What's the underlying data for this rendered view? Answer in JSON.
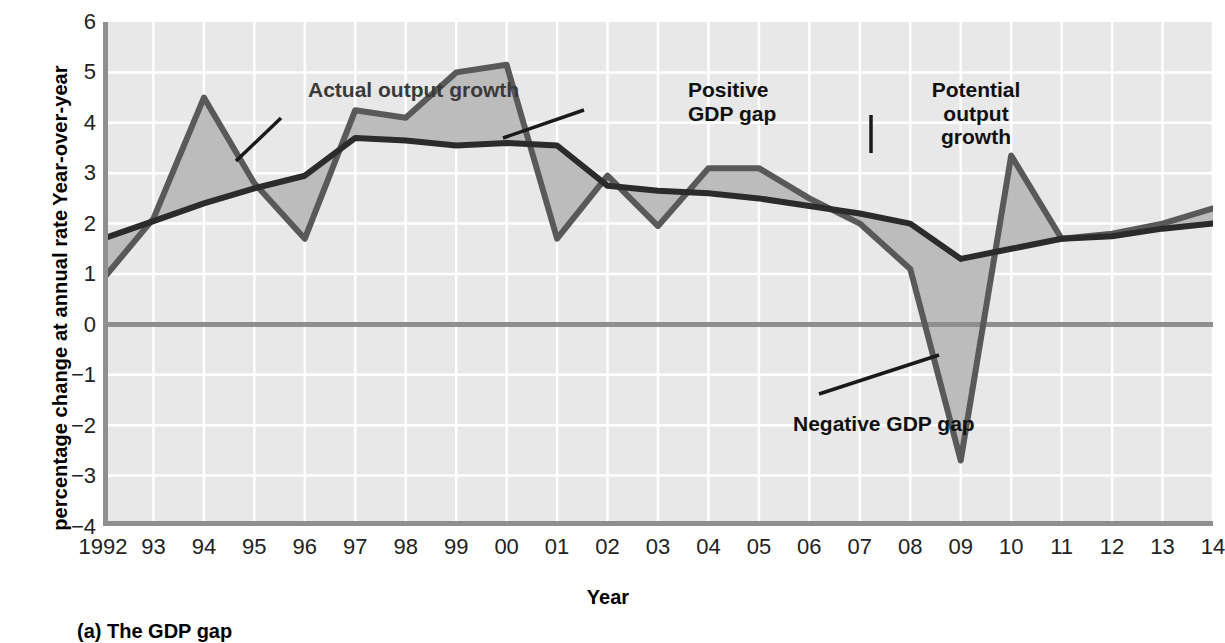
{
  "figure": {
    "caption": "(a) The GDP gap",
    "xlabel": "Year",
    "ylabel_line1": "Year-over-year",
    "ylabel_line2": "percentage change at annual rate"
  },
  "annotations": {
    "actual": "Actual output growth",
    "positive_gap": "Positive\nGDP gap",
    "potential": "Potential\noutput\ngrowth",
    "negative_gap": "Negative GDP gap"
  },
  "colors": {
    "plot_background": "#e8e8e8",
    "gridline": "#ffffff",
    "axis_line": "#8f8f8f",
    "zero_line": "#8f8f8f",
    "actual_line": "#595959",
    "potential_line": "#2b2b2b",
    "gap_fill": "#b9b9b9",
    "annotation_grey": "#3a3a3a",
    "annotation_black": "#111111"
  },
  "chart_data": {
    "type": "line",
    "title": "(a) The GDP gap",
    "xlabel": "Year",
    "ylabel": "Year-over-year percentage change at annual rate",
    "grid": true,
    "legend": "annotations",
    "xlim": [
      1992,
      2014
    ],
    "ylim": [
      -4,
      6
    ],
    "yticks": [
      6,
      5,
      4,
      3,
      2,
      1,
      0,
      -1,
      -2,
      -3,
      -4
    ],
    "ytick_labels": [
      "6",
      "5",
      "4",
      "3",
      "2",
      "1",
      "0",
      "−1",
      "−2",
      "−3",
      "−4"
    ],
    "x": [
      1992,
      1993,
      1994,
      1995,
      1996,
      1997,
      1998,
      1999,
      2000,
      2001,
      2002,
      2003,
      2004,
      2005,
      2006,
      2007,
      2008,
      2009,
      2010,
      2011,
      2012,
      2013,
      2014
    ],
    "xtick_labels": [
      "1992",
      "93",
      "94",
      "95",
      "96",
      "97",
      "98",
      "99",
      "00",
      "01",
      "02",
      "03",
      "04",
      "05",
      "06",
      "07",
      "08",
      "09",
      "10",
      "11",
      "12",
      "13",
      "14"
    ],
    "series": [
      {
        "name": "Actual output growth",
        "values": [
          0.9,
          2.1,
          4.5,
          2.8,
          1.7,
          4.25,
          4.1,
          5.0,
          5.15,
          1.7,
          2.95,
          1.95,
          3.1,
          3.1,
          2.5,
          2.0,
          1.1,
          -2.7,
          3.35,
          1.7,
          1.8,
          2.0,
          2.3
        ]
      },
      {
        "name": "Potential output growth",
        "values": [
          1.7,
          2.05,
          2.4,
          2.7,
          2.95,
          3.7,
          3.65,
          3.55,
          3.6,
          3.55,
          2.75,
          2.65,
          2.6,
          2.5,
          2.35,
          2.2,
          2.0,
          1.3,
          1.5,
          1.7,
          1.75,
          1.9,
          2.0
        ]
      }
    ],
    "shaded_region": {
      "name": "GDP gap",
      "description": "Area between actual and potential output growth; positive where actual exceeds potential, negative where actual falls below potential."
    }
  }
}
